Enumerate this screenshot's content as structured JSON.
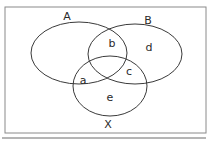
{
  "diagram": {
    "type": "venn",
    "sets": [
      {
        "id": "A",
        "label": "A",
        "cx": 79,
        "cy": 53,
        "rx": 48,
        "ry": 31,
        "label_x": 67,
        "label_y": 20
      },
      {
        "id": "B",
        "label": "B",
        "cx": 135,
        "cy": 54,
        "rx": 47,
        "ry": 30,
        "label_x": 148,
        "label_y": 24
      },
      {
        "id": "X",
        "label": "X",
        "cx": 110,
        "cy": 86,
        "rx": 37,
        "ry": 30,
        "label_x": 108,
        "label_y": 128
      }
    ],
    "regions": [
      {
        "label": "b",
        "x": 112,
        "y": 47
      },
      {
        "label": "d",
        "x": 149,
        "y": 51
      },
      {
        "label": "c",
        "x": 129,
        "y": 75
      },
      {
        "label": "a",
        "x": 83,
        "y": 84
      },
      {
        "label": "e",
        "x": 110,
        "y": 101
      }
    ],
    "frame": {
      "x": 5,
      "y": 7,
      "width": 201,
      "height": 126
    },
    "colors": {
      "stroke": "#3a3a3a",
      "frame": "#8a8a8a",
      "baseline": "#b5b5b5"
    }
  }
}
